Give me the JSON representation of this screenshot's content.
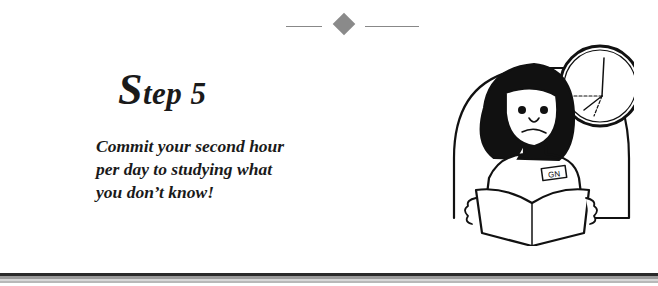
{
  "header": {
    "divider_icon": "diamond-icon"
  },
  "step": {
    "initial": "S",
    "rest": "tep 5"
  },
  "instruction": {
    "lines": [
      "Commit your second hour",
      "per day to studying what",
      "you don’t know!"
    ]
  },
  "illustration": {
    "description": "worried woman reading a book in front of a clock",
    "name_badge": "GN"
  },
  "colors": {
    "text": "#1a1a1a",
    "divider": "#8a8a8a"
  }
}
